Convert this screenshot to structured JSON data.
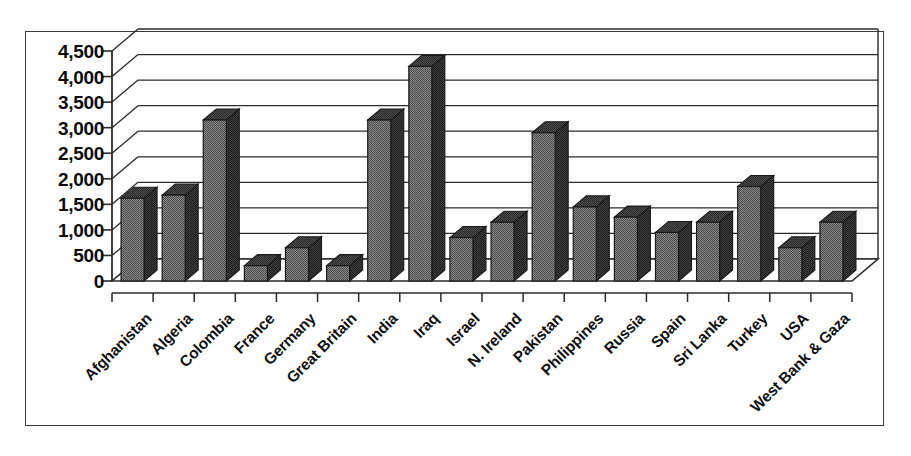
{
  "chart_data": {
    "type": "bar",
    "title": "",
    "subtitle": "",
    "xlabel": "",
    "ylabel": "",
    "ylim": [
      0,
      4500
    ],
    "ytick_step": 500,
    "grid": true,
    "legend": false,
    "style": "3d-column",
    "bar_color": "#6e6e6e",
    "bar_edge_color": "#1a1a1a",
    "axis_color": "#2b2b2b",
    "grid_color": "#2b2b2b",
    "background": "#ffffff",
    "ytick_labels": [
      "4,500",
      "4,000",
      "3,500",
      "3,000",
      "2,500",
      "2,000",
      "1,500",
      "1,000",
      "500",
      "0"
    ],
    "ytick_values": [
      4500,
      4000,
      3500,
      3000,
      2500,
      2000,
      1500,
      1000,
      500,
      0
    ],
    "categories": [
      "Afghanistan",
      "Algeria",
      "Colombia",
      "France",
      "Germany",
      "Great Britain",
      "India",
      "Iraq",
      "Israel",
      "N. Ireland",
      "Pakistan",
      "Philippines",
      "Russia",
      "Spain",
      "Sri Lanka",
      "Turkey",
      "USA",
      "West Bank & Gaza"
    ],
    "values": [
      1620,
      1680,
      3150,
      300,
      650,
      300,
      3150,
      4200,
      850,
      1150,
      2900,
      1450,
      1250,
      950,
      1150,
      1850,
      650,
      1150
    ]
  }
}
